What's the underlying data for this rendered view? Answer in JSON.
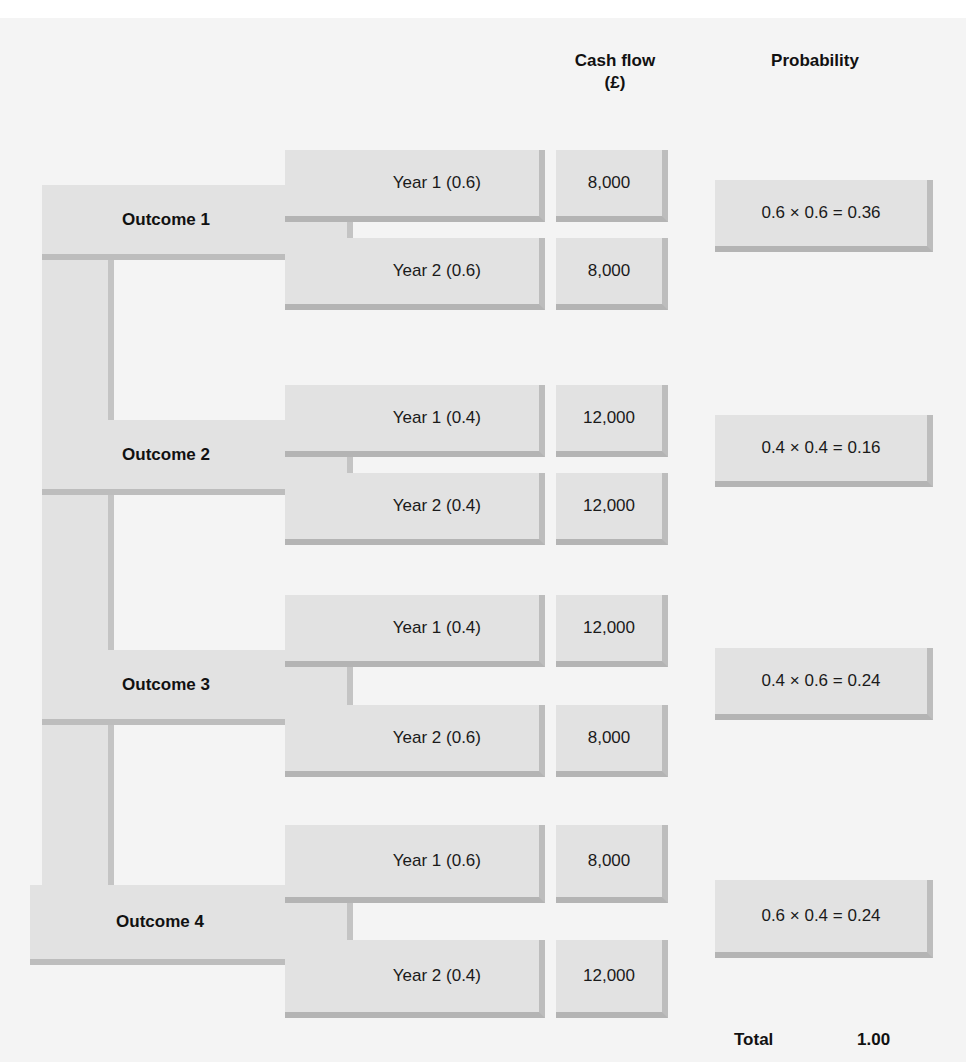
{
  "headers": {
    "cash_flow_line1": "Cash flow",
    "cash_flow_line2": "(£)",
    "probability": "Probability"
  },
  "outcomes": [
    {
      "label": "Outcome 1",
      "years": [
        {
          "label": "Year 1 (0.6)",
          "cash_flow": "8,000"
        },
        {
          "label": "Year 2 (0.6)",
          "cash_flow": "8,000"
        }
      ],
      "probability": "0.6 × 0.6 = 0.36"
    },
    {
      "label": "Outcome 2",
      "years": [
        {
          "label": "Year 1 (0.4)",
          "cash_flow": "12,000"
        },
        {
          "label": "Year 2 (0.4)",
          "cash_flow": "12,000"
        }
      ],
      "probability": "0.4 × 0.4 = 0.16"
    },
    {
      "label": "Outcome 3",
      "years": [
        {
          "label": "Year 1 (0.4)",
          "cash_flow": "12,000"
        },
        {
          "label": "Year 2 (0.6)",
          "cash_flow": "8,000"
        }
      ],
      "probability": "0.4 × 0.6 = 0.24"
    },
    {
      "label": "Outcome 4",
      "years": [
        {
          "label": "Year 1 (0.6)",
          "cash_flow": "8,000"
        },
        {
          "label": "Year 2 (0.4)",
          "cash_flow": "12,000"
        }
      ],
      "probability": "0.6 × 0.4 = 0.24"
    }
  ],
  "total": {
    "label": "Total",
    "value": "1.00"
  },
  "colors": {
    "canvas": "#f4f4f4",
    "box_fill": "#e2e2e2",
    "box_shadow": "#bdbdbd",
    "text": "#1a1a1a"
  }
}
